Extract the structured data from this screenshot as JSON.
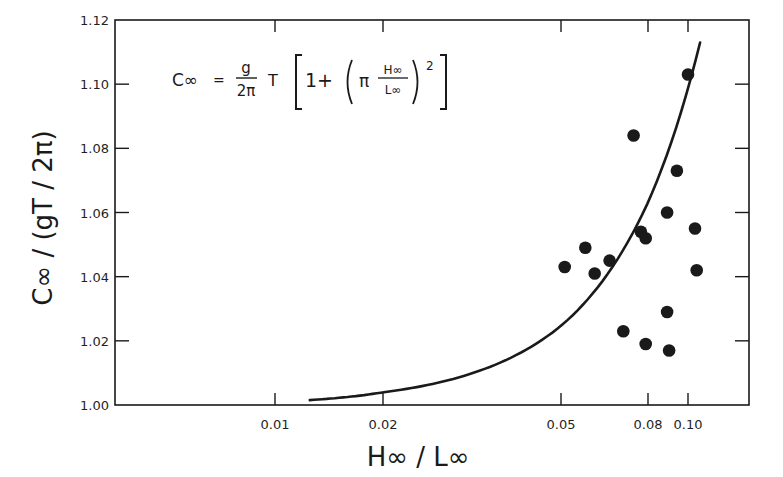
{
  "chart_data": {
    "type": "scatter",
    "title": "",
    "xlabel": "H∞ / L∞",
    "ylabel": "C∞ / (gT / 2π)",
    "x_scale": "log (non-uniform tick spacing)",
    "xlim": [
      0.0045,
      0.15
    ],
    "ylim": [
      1.0,
      1.12
    ],
    "grid": false,
    "legend": null,
    "x_ticks": [
      {
        "value": 0.01,
        "label": "0.01",
        "px": 275
      },
      {
        "value": 0.02,
        "label": "0.02",
        "px": 383
      },
      {
        "value": 0.05,
        "label": "0.05",
        "px": 561
      },
      {
        "value": 0.08,
        "label": "0.08",
        "px": 648
      },
      {
        "value": 0.1,
        "label": "0.10",
        "px": 688
      }
    ],
    "y_ticks": [
      {
        "value": 1.0,
        "label": "1.00"
      },
      {
        "value": 1.02,
        "label": "1.02"
      },
      {
        "value": 1.04,
        "label": "1.04"
      },
      {
        "value": 1.06,
        "label": "1.06"
      },
      {
        "value": 1.08,
        "label": "1.08"
      },
      {
        "value": 1.1,
        "label": "1.10"
      },
      {
        "value": 1.12,
        "label": "1.12"
      }
    ],
    "annotation": {
      "text": "C∞ = (g / 2π) T [ 1 + ( π H∞ / L∞ )² ]",
      "lhs": "C∞",
      "eq": "=",
      "frac_num": "g",
      "frac_den": "2π",
      "T": "T",
      "one_plus": "1+",
      "pi": "π",
      "inner_num": "H∞",
      "inner_den": "L∞",
      "power": "2"
    },
    "series": [
      {
        "name": "theory curve",
        "type": "line",
        "formula": "1 + (π·H/L)^2",
        "points": [
          {
            "x": 0.0125,
            "y": 1.0015
          },
          {
            "x": 0.02,
            "y": 1.004
          },
          {
            "x": 0.03,
            "y": 1.009
          },
          {
            "x": 0.04,
            "y": 1.016
          },
          {
            "x": 0.05,
            "y": 1.025
          },
          {
            "x": 0.06,
            "y": 1.036
          },
          {
            "x": 0.07,
            "y": 1.048
          },
          {
            "x": 0.08,
            "y": 1.063
          },
          {
            "x": 0.09,
            "y": 1.08
          },
          {
            "x": 0.1,
            "y": 1.099
          },
          {
            "x": 0.107,
            "y": 1.117
          }
        ]
      },
      {
        "name": "measured",
        "type": "scatter",
        "marker": "filled-circle",
        "points": [
          {
            "x": 0.051,
            "y": 1.043
          },
          {
            "x": 0.057,
            "y": 1.049
          },
          {
            "x": 0.06,
            "y": 1.041
          },
          {
            "x": 0.065,
            "y": 1.045
          },
          {
            "x": 0.07,
            "y": 1.023
          },
          {
            "x": 0.074,
            "y": 1.084
          },
          {
            "x": 0.077,
            "y": 1.054
          },
          {
            "x": 0.079,
            "y": 1.052
          },
          {
            "x": 0.079,
            "y": 1.019
          },
          {
            "x": 0.089,
            "y": 1.06
          },
          {
            "x": 0.089,
            "y": 1.029
          },
          {
            "x": 0.09,
            "y": 1.017
          },
          {
            "x": 0.094,
            "y": 1.073
          },
          {
            "x": 0.1,
            "y": 1.103
          },
          {
            "x": 0.104,
            "y": 1.055
          },
          {
            "x": 0.105,
            "y": 1.042
          }
        ]
      }
    ]
  },
  "colors": {
    "ink": "#1a1a1a",
    "background": "#ffffff"
  }
}
